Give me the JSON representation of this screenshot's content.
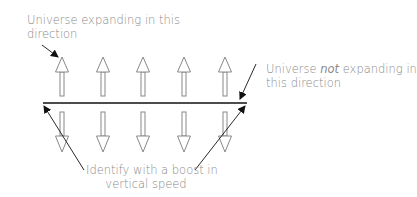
{
  "labels": {
    "expanding": {
      "line1": "Universe expanding in this",
      "line2": "direction"
    },
    "not_expanding": {
      "line1_pre": "Universe ",
      "line1_em": "not",
      "line1_post": " expanding in",
      "line2": "this direction"
    },
    "boost": {
      "line1": "Identify with a boost in",
      "line2": "vertical speed"
    }
  },
  "arrows": {
    "count": 5,
    "x_positions": [
      62,
      103,
      143,
      184,
      225
    ],
    "up_direction": "up",
    "down_direction": "down"
  },
  "colors": {
    "text": "#8a8a8a",
    "arrow_outline": "#888888",
    "line": "#111111",
    "pointer": "#111111"
  }
}
